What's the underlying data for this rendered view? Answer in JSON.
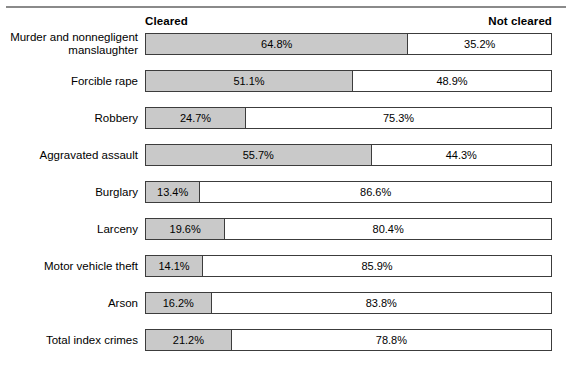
{
  "header": {
    "left_label": "Cleared",
    "right_label": "Not cleared"
  },
  "chart_data": {
    "type": "bar",
    "subtype": "stacked-horizontal-100-percent",
    "title": "",
    "subtitle": "",
    "xlabel": "",
    "ylabel": "",
    "xlim": [
      0,
      100
    ],
    "grid": false,
    "legend_position": "top",
    "legend": [
      "Cleared",
      "Not cleared"
    ],
    "unit": "%",
    "categories": [
      "Murder and nonnegligent manslaughter",
      "Forcible rape",
      "Robbery",
      "Aggravated assault",
      "Burglary",
      "Larceny",
      "Motor vehicle theft",
      "Arson",
      "Total index crimes"
    ],
    "series": [
      {
        "name": "Cleared",
        "values": [
          64.8,
          51.1,
          24.7,
          55.7,
          13.4,
          19.6,
          14.1,
          16.2,
          21.2
        ]
      },
      {
        "name": "Not cleared",
        "values": [
          35.2,
          48.9,
          75.3,
          44.3,
          86.6,
          80.4,
          85.9,
          83.8,
          78.8
        ]
      }
    ],
    "colors": {
      "cleared": "#c9c9c9",
      "not_cleared": "#ffffff",
      "outline": "#3c3c3c",
      "rule": "#8a8a8a"
    }
  },
  "rows": [
    {
      "label": "Murder and nonnegligent\nmanslaughter",
      "cleared": 64.8,
      "not_cleared": 35.2,
      "cleared_text": "64.8%",
      "not_cleared_text": "35.2%"
    },
    {
      "label": "Forcible rape",
      "cleared": 51.1,
      "not_cleared": 48.9,
      "cleared_text": "51.1%",
      "not_cleared_text": "48.9%"
    },
    {
      "label": "Robbery",
      "cleared": 24.7,
      "not_cleared": 75.3,
      "cleared_text": "24.7%",
      "not_cleared_text": "75.3%"
    },
    {
      "label": "Aggravated assault",
      "cleared": 55.7,
      "not_cleared": 44.3,
      "cleared_text": "55.7%",
      "not_cleared_text": "44.3%"
    },
    {
      "label": "Burglary",
      "cleared": 13.4,
      "not_cleared": 86.6,
      "cleared_text": "13.4%",
      "not_cleared_text": "86.6%"
    },
    {
      "label": "Larceny",
      "cleared": 19.6,
      "not_cleared": 80.4,
      "cleared_text": "19.6%",
      "not_cleared_text": "80.4%"
    },
    {
      "label": "Motor vehicle theft",
      "cleared": 14.1,
      "not_cleared": 85.9,
      "cleared_text": "14.1%",
      "not_cleared_text": "85.9%"
    },
    {
      "label": "Arson",
      "cleared": 16.2,
      "not_cleared": 83.8,
      "cleared_text": "16.2%",
      "not_cleared_text": "83.8%"
    },
    {
      "label": "Total index crimes",
      "cleared": 21.2,
      "not_cleared": 78.8,
      "cleared_text": "21.2%",
      "not_cleared_text": "78.8%"
    }
  ]
}
